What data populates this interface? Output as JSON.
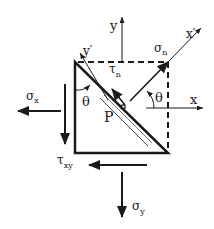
{
  "diagram": {
    "colors": {
      "stroke": "#1a1a1a",
      "background": "#ffffff"
    },
    "labels": {
      "y_axis": "y",
      "x_axis": "x",
      "y_prime": "y′",
      "x_prime": "x′",
      "sigma_n": "σ",
      "sigma_n_sub": "n",
      "tau_n": "τ",
      "tau_n_sub": "n",
      "theta_left": "θ",
      "theta_right": "θ",
      "sigma_x": "σ",
      "sigma_x_sub": "x",
      "point": "P",
      "tau_xy": "τ",
      "tau_xy_sub": "xy",
      "sigma_y": "σ",
      "sigma_y_sub": "y"
    }
  }
}
